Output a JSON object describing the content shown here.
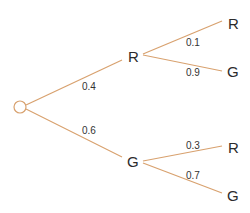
{
  "diagram": {
    "type": "probability-tree",
    "line_color": "#d8a16e",
    "root": {
      "shape": "circle"
    },
    "level1": [
      {
        "label": "R",
        "probability": "0.4",
        "children": [
          {
            "label": "R",
            "probability": "0.1"
          },
          {
            "label": "G",
            "probability": "0.9"
          }
        ]
      },
      {
        "label": "G",
        "probability": "0.6",
        "children": [
          {
            "label": "R",
            "probability": "0.3"
          },
          {
            "label": "G",
            "probability": "0.7"
          }
        ]
      }
    ]
  }
}
